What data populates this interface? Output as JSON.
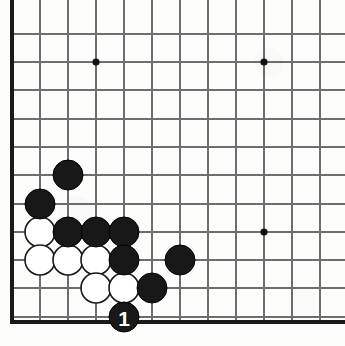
{
  "figure": {
    "board_size": 19,
    "view": "bottom-left corner",
    "width": 345,
    "height": 346,
    "background_color": "#fdfdfc"
  },
  "board": {
    "cell_size": 28,
    "origin_x": 12,
    "origin_y": 34,
    "stone_radius": 15,
    "line_color": "#6e6e6e",
    "edge_color": "#1a1a1a",
    "columns_x": [
      12,
      40,
      68,
      96,
      124,
      152,
      180,
      208,
      236,
      264,
      292,
      320
    ],
    "rows_y": [
      34,
      62,
      90,
      119,
      147,
      175,
      204,
      232,
      260,
      288,
      317
    ],
    "edges": {
      "left_x": 12,
      "bottom_y": 322
    },
    "star_points": [
      {
        "name": "star-point-upper-left",
        "x": 96,
        "y": 62
      },
      {
        "name": "star-point-upper-right",
        "x": 264,
        "y": 62
      },
      {
        "name": "star-point-center-right",
        "x": 264,
        "y": 232
      }
    ]
  },
  "stones": {
    "black_color": "#181818",
    "white_color": "#ffffff",
    "black": [
      {
        "id": "black-stone-1",
        "x": 68,
        "y": 175
      },
      {
        "id": "black-stone-2",
        "x": 40,
        "y": 204
      },
      {
        "id": "black-stone-3",
        "x": 68,
        "y": 232
      },
      {
        "id": "black-stone-4",
        "x": 96,
        "y": 232
      },
      {
        "id": "black-stone-5",
        "x": 124,
        "y": 232
      },
      {
        "id": "black-stone-6",
        "x": 124,
        "y": 260
      },
      {
        "id": "black-stone-7",
        "x": 180,
        "y": 260
      },
      {
        "id": "black-stone-8",
        "x": 152,
        "y": 288
      }
    ],
    "white": [
      {
        "id": "white-stone-1",
        "x": 40,
        "y": 232
      },
      {
        "id": "white-stone-2",
        "x": 40,
        "y": 260
      },
      {
        "id": "white-stone-3",
        "x": 68,
        "y": 260
      },
      {
        "id": "white-stone-4",
        "x": 96,
        "y": 260
      },
      {
        "id": "white-stone-5",
        "x": 96,
        "y": 288
      },
      {
        "id": "white-stone-6",
        "x": 124,
        "y": 288
      }
    ],
    "numbered": [
      {
        "id": "move-stone-1",
        "label": "1",
        "color": "black",
        "label_color": "#ffffff",
        "x": 124,
        "y": 317
      }
    ]
  }
}
